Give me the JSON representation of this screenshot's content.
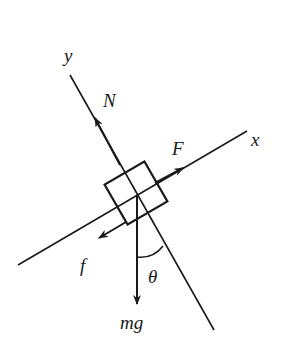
{
  "diagram": {
    "type": "free-body-diagram",
    "axes": {
      "x_label": "x",
      "y_label": "y"
    },
    "forces": {
      "normal": "N",
      "applied": "F",
      "friction": "f",
      "weight": "mg"
    },
    "angle_label": "θ",
    "colors": {
      "stroke": "#1a1a1a",
      "background": "#ffffff"
    }
  }
}
